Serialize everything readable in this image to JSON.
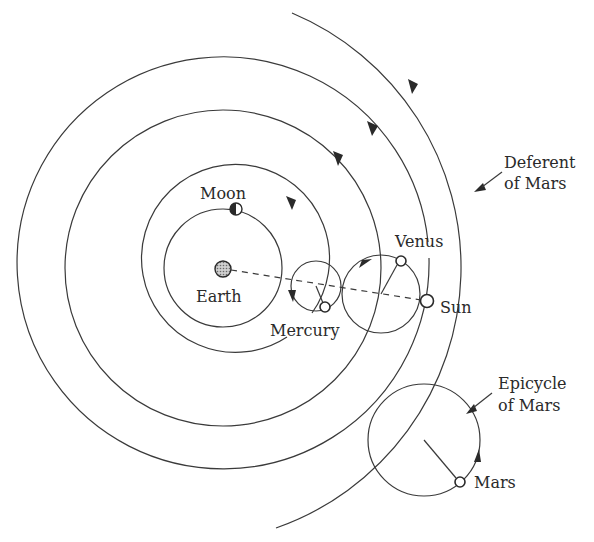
{
  "figure": {
    "labels": {
      "moon": "Moon",
      "earth": "Earth",
      "mercury": "Mercury",
      "venus": "Venus",
      "sun": "Sun",
      "mars": "Mars",
      "deferent_line1": "Deferent",
      "deferent_line2": "of Mars",
      "epicycle_line1": "Epicycle",
      "epicycle_line2": "of Mars"
    },
    "bodies": [
      {
        "name": "Earth",
        "role": "center",
        "fill": "dotted-gray"
      },
      {
        "name": "Moon",
        "role": "orbits Earth",
        "fill": "half-dark"
      },
      {
        "name": "Mercury",
        "role": "on epicycle",
        "fill": "white"
      },
      {
        "name": "Venus",
        "role": "on epicycle",
        "fill": "white"
      },
      {
        "name": "Sun",
        "role": "on deferent",
        "fill": "white"
      },
      {
        "name": "Mars",
        "role": "on epicycle of Mars",
        "fill": "white"
      }
    ],
    "colors": {
      "line": "#3a3a3a",
      "text": "#2a2a2a",
      "background": "#ffffff"
    }
  }
}
